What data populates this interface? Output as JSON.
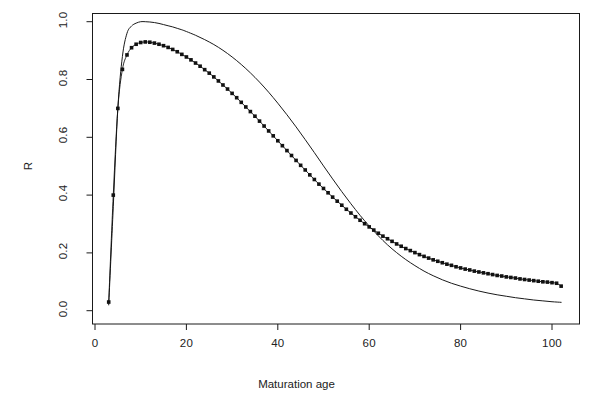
{
  "chart_data": {
    "type": "line",
    "title": "",
    "xlabel": "Maturation age",
    "ylabel": "R",
    "xlim": [
      0,
      105
    ],
    "ylim": [
      -0.02,
      1.04
    ],
    "grid": false,
    "legend": null,
    "xticks": [
      0,
      20,
      40,
      60,
      80,
      100
    ],
    "xticklabels": [
      "0",
      "20",
      "40",
      "60",
      "80",
      "100"
    ],
    "yticks": [
      0.0,
      0.2,
      0.4,
      0.6,
      0.8,
      1.0
    ],
    "yticklabels": [
      "0.0",
      "0.2",
      "0.4",
      "0.6",
      "0.8",
      "1.0"
    ],
    "annotations": [
      "Two curves cross near maturation age 68 at R = 0.17"
    ],
    "series": [
      {
        "name": "smooth-curve",
        "style": "solid-line",
        "marker": "none",
        "color": "#1a1a1a",
        "x": [
          3,
          4,
          5,
          6,
          7,
          8,
          9,
          10,
          11,
          12,
          13,
          14,
          15,
          16,
          17,
          18,
          19,
          20,
          22,
          24,
          26,
          28,
          30,
          32,
          34,
          36,
          38,
          40,
          42,
          44,
          46,
          48,
          50,
          52,
          54,
          56,
          58,
          60,
          62,
          64,
          66,
          68,
          70,
          72,
          74,
          76,
          78,
          80,
          82,
          84,
          86,
          88,
          90,
          92,
          94,
          96,
          98,
          100,
          102
        ],
        "y": [
          0.02,
          0.36,
          0.7,
          0.88,
          0.96,
          0.985,
          0.995,
          1.0,
          1.0,
          0.999,
          0.997,
          0.994,
          0.99,
          0.986,
          0.982,
          0.977,
          0.972,
          0.966,
          0.953,
          0.938,
          0.921,
          0.901,
          0.878,
          0.852,
          0.823,
          0.791,
          0.756,
          0.718,
          0.678,
          0.636,
          0.592,
          0.547,
          0.501,
          0.456,
          0.412,
          0.37,
          0.33,
          0.293,
          0.259,
          0.228,
          0.201,
          0.177,
          0.156,
          0.137,
          0.121,
          0.107,
          0.095,
          0.085,
          0.076,
          0.068,
          0.061,
          0.055,
          0.05,
          0.045,
          0.041,
          0.037,
          0.034,
          0.031,
          0.029
        ]
      },
      {
        "name": "dotted-curve",
        "style": "point-line",
        "marker": "filled-square",
        "color": "#111111",
        "x": [
          3,
          4,
          5,
          6,
          7,
          8,
          9,
          10,
          11,
          12,
          13,
          14,
          15,
          16,
          17,
          18,
          19,
          20,
          21,
          22,
          23,
          24,
          25,
          26,
          27,
          28,
          29,
          30,
          31,
          32,
          33,
          34,
          35,
          36,
          37,
          38,
          39,
          40,
          41,
          42,
          43,
          44,
          45,
          46,
          47,
          48,
          49,
          50,
          51,
          52,
          53,
          54,
          55,
          56,
          57,
          58,
          59,
          60,
          61,
          62,
          63,
          64,
          65,
          66,
          67,
          68,
          69,
          70,
          71,
          72,
          73,
          74,
          75,
          76,
          77,
          78,
          79,
          80,
          81,
          82,
          83,
          84,
          85,
          86,
          87,
          88,
          89,
          90,
          91,
          92,
          93,
          94,
          95,
          96,
          97,
          98,
          99,
          100,
          101,
          102
        ],
        "y": [
          0.03,
          0.4,
          0.7,
          0.835,
          0.885,
          0.91,
          0.922,
          0.928,
          0.93,
          0.929,
          0.926,
          0.922,
          0.917,
          0.911,
          0.904,
          0.896,
          0.887,
          0.878,
          0.868,
          0.857,
          0.846,
          0.834,
          0.822,
          0.809,
          0.795,
          0.781,
          0.767,
          0.752,
          0.737,
          0.721,
          0.705,
          0.689,
          0.673,
          0.656,
          0.639,
          0.622,
          0.605,
          0.588,
          0.571,
          0.554,
          0.537,
          0.52,
          0.503,
          0.487,
          0.47,
          0.454,
          0.438,
          0.423,
          0.408,
          0.393,
          0.379,
          0.365,
          0.351,
          0.338,
          0.325,
          0.313,
          0.301,
          0.29,
          0.279,
          0.268,
          0.258,
          0.249,
          0.24,
          0.231,
          0.223,
          0.215,
          0.208,
          0.201,
          0.194,
          0.188,
          0.182,
          0.176,
          0.171,
          0.166,
          0.161,
          0.157,
          0.152,
          0.148,
          0.144,
          0.141,
          0.137,
          0.134,
          0.131,
          0.128,
          0.125,
          0.122,
          0.12,
          0.117,
          0.115,
          0.113,
          0.11,
          0.108,
          0.106,
          0.104,
          0.102,
          0.1,
          0.099,
          0.097,
          0.095,
          0.085
        ]
      }
    ]
  }
}
